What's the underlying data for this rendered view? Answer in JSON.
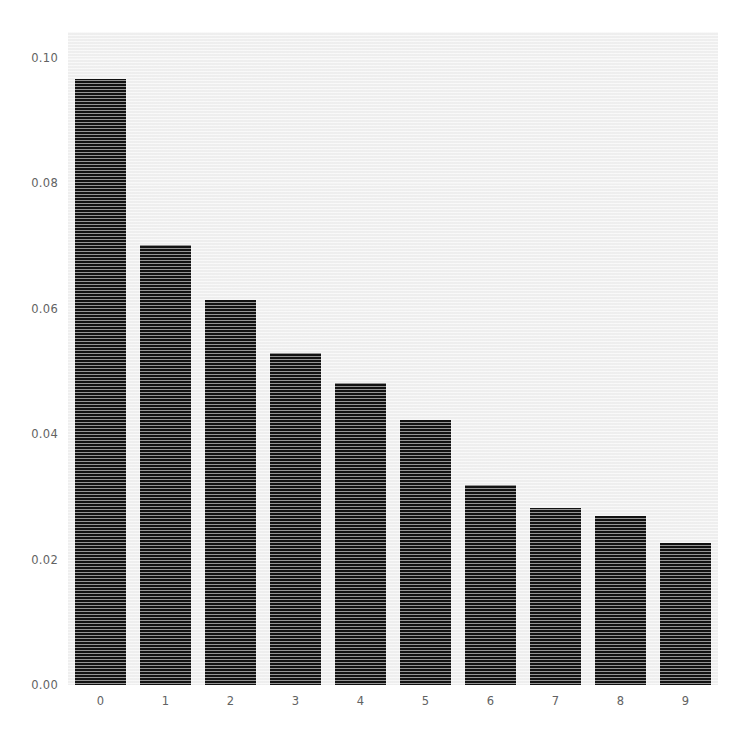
{
  "chart_data": {
    "type": "bar",
    "title": "",
    "subtitle": "",
    "xlabel": "",
    "ylabel": "",
    "categories": [
      "0",
      "1",
      "2",
      "3",
      "4",
      "5",
      "6",
      "7",
      "8",
      "9"
    ],
    "values": [
      0.0966,
      0.0701,
      0.0614,
      0.053,
      0.0482,
      0.0422,
      0.0319,
      0.0282,
      0.027,
      0.0226
    ],
    "ylim": [
      0.0,
      0.1041
    ],
    "xlim": [
      -0.5,
      9.5
    ],
    "ytick_labels": [
      "0.00",
      "0.02",
      "0.04",
      "0.06",
      "0.08",
      "0.10"
    ],
    "ytick_values": [
      0.0,
      0.02,
      0.04,
      0.06,
      0.08,
      0.1
    ],
    "xtick_labels": [
      "0",
      "1",
      "2",
      "3",
      "4",
      "5",
      "6",
      "7",
      "8",
      "9"
    ],
    "grid": false,
    "legend": null,
    "legend_position": "none",
    "bar_color": "#121212",
    "plot_background": "#f1f1f1",
    "figure_background": "#ffffff",
    "tick_label_color": "#626262",
    "bar_width_fraction": 0.78,
    "annotations": []
  }
}
